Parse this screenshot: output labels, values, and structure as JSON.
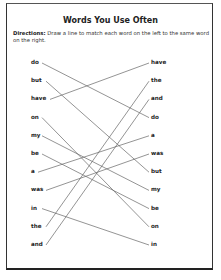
{
  "worksheet": {
    "title": "Words You Use Often",
    "directions_label": "Directions:",
    "directions_text": " Draw a line to match each word on the left to the same word on the right.",
    "left_words": [
      "do",
      "but",
      "have",
      "on",
      "my",
      "be",
      "a",
      "was",
      "in",
      "the",
      "and"
    ],
    "right_words": [
      "have",
      "the",
      "and",
      "do",
      "a",
      "was",
      "but",
      "my",
      "be",
      "on",
      "in"
    ],
    "line_color": "#666666"
  }
}
